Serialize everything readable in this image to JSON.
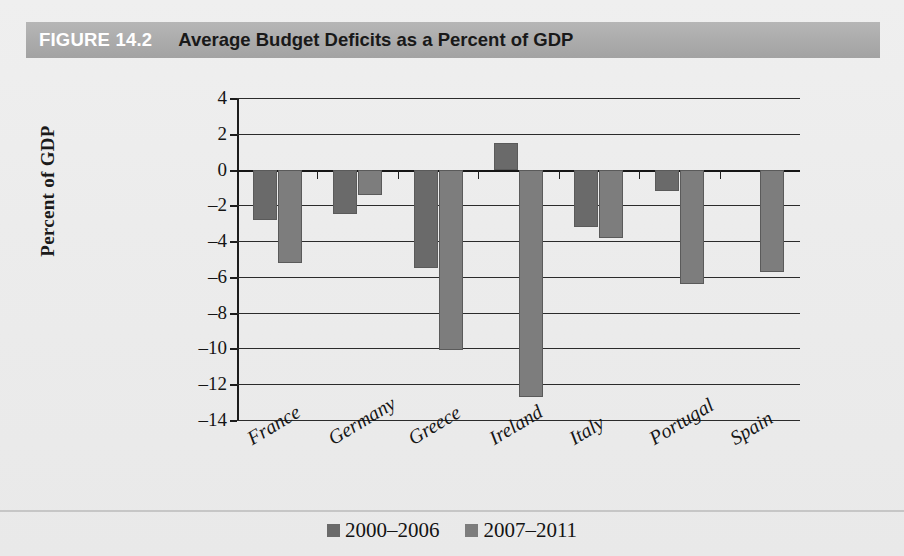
{
  "figure": {
    "number_label": "FIGURE 14.2",
    "title": "Average Budget Deficits as a Percent of GDP"
  },
  "colors": {
    "header_band": "#ababab",
    "page_background": "#ececec",
    "series_1": "#6a6a6a",
    "series_2": "#7d7d7d",
    "axis": "#1c1c1c"
  },
  "legend": {
    "position": "bottom-center",
    "entries": [
      {
        "label": "2000–2006",
        "color": "#6a6a6a"
      },
      {
        "label": "2007–2011",
        "color": "#7d7d7d"
      }
    ]
  },
  "axes": {
    "ylabel": "Percent of GDP",
    "xlabel": "",
    "ytick_labels": [
      "4",
      "2",
      "0",
      "–2",
      "–4",
      "–6",
      "–8",
      "–10",
      "–12",
      "–14"
    ],
    "ylim": [
      -14,
      4
    ],
    "ystep": 2
  },
  "chart_data": {
    "type": "bar",
    "title": "Average Budget Deficits as a Percent of GDP",
    "xlabel": "",
    "ylabel": "Percent of GDP",
    "ylim": [
      -14,
      4
    ],
    "ytick_step": 2,
    "grid": true,
    "legend_position": "bottom-center",
    "categories": [
      "France",
      "Germany",
      "Greece",
      "Ireland",
      "Italy",
      "Portugal",
      "Spain"
    ],
    "series": [
      {
        "name": "2000–2006",
        "color": "#6a6a6a",
        "values": [
          -2.8,
          -2.5,
          -5.5,
          1.5,
          -3.2,
          -1.2,
          0.0
        ]
      },
      {
        "name": "2007–2011",
        "color": "#7d7d7d",
        "values": [
          -5.2,
          -1.4,
          -10.1,
          -12.7,
          -3.8,
          -6.4,
          -5.7
        ]
      }
    ]
  }
}
